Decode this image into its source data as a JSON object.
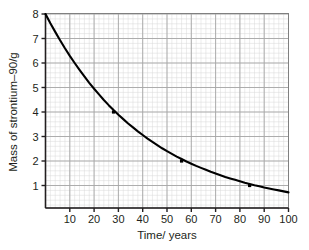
{
  "chart_data": {
    "type": "line",
    "title": "",
    "subtitle": "",
    "xlabel": "Time/ years",
    "ylabel": "Mass of strontium–90/g",
    "xlim": [
      0,
      100
    ],
    "ylim": [
      0,
      8
    ],
    "grid": true,
    "grid_minor": true,
    "grid_minor_step_x": 2,
    "grid_minor_step_y": 0.2,
    "legend": "none",
    "x_ticks": [
      10,
      20,
      30,
      40,
      50,
      60,
      70,
      80,
      90,
      100
    ],
    "x_tick_labels": [
      "10",
      "20",
      "30",
      "40",
      "50",
      "60",
      "70",
      "80",
      "90",
      "100"
    ],
    "y_ticks": [
      1,
      2,
      3,
      4,
      5,
      6,
      7,
      8
    ],
    "y_tick_labels": [
      "1",
      "2",
      "3",
      "4",
      "5",
      "6",
      "7",
      "8"
    ],
    "series": [
      {
        "name": "Mass of strontium-90",
        "color": "#000000",
        "x": [
          0,
          2,
          4,
          6,
          8,
          10,
          12,
          14,
          16,
          18,
          20,
          22,
          24,
          26,
          28,
          30,
          32,
          34,
          36,
          38,
          40,
          42,
          44,
          46,
          48,
          50,
          52,
          54,
          56,
          58,
          60,
          62,
          64,
          66,
          68,
          70,
          72,
          74,
          76,
          78,
          80,
          82,
          84,
          86,
          88,
          90,
          92,
          94,
          96,
          98,
          100
        ],
        "y": [
          8.0,
          7.62,
          7.27,
          6.93,
          6.6,
          6.29,
          6.0,
          5.72,
          5.45,
          5.19,
          4.95,
          4.72,
          4.49,
          4.28,
          4.08,
          3.89,
          3.71,
          3.53,
          3.37,
          3.21,
          3.06,
          2.91,
          2.78,
          2.65,
          2.52,
          2.4,
          2.29,
          2.18,
          2.08,
          1.98,
          1.89,
          1.8,
          1.72,
          1.64,
          1.56,
          1.49,
          1.42,
          1.35,
          1.29,
          1.23,
          1.17,
          1.11,
          1.06,
          1.01,
          0.97,
          0.92,
          0.88,
          0.84,
          0.8,
          0.76,
          0.72
        ]
      }
    ],
    "marked_points": [
      {
        "label": "28 years, 4 g",
        "x": 28,
        "y": 4
      },
      {
        "label": "56 years, 2 g",
        "x": 56,
        "y": 2
      },
      {
        "label": "84 years, 1 g",
        "x": 84,
        "y": 1
      }
    ],
    "half_life_years": 28,
    "initial_mass_g": 8
  }
}
